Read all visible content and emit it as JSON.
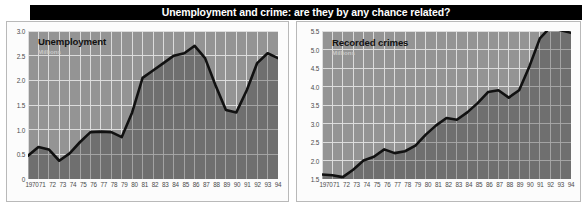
{
  "banner": {
    "title": "Unemployment and crime: are they by any chance related?",
    "background_color": "#000000",
    "text_color": "#ffffff"
  },
  "colors": {
    "plot_background": "#949494",
    "area_fill": "#6f6f6f",
    "gridline": "#e8e8e8",
    "line": "#111111",
    "axis_text": "#4a4a4a",
    "panel_border": "#b9b9b9",
    "caption_sub": "#c9c9c9"
  },
  "charts": [
    {
      "panel": "left",
      "caption_title": "Unemployment",
      "caption_sub": "Millions",
      "chart_data": {
        "type": "area",
        "title": "Unemployment",
        "subtitle": "Millions",
        "xlabel": "",
        "ylabel": "Millions",
        "ylim": [
          0,
          3.0
        ],
        "yticks": [
          0,
          0.5,
          1.0,
          1.5,
          2.0,
          2.5,
          3.0
        ],
        "ytick_labels": [
          "0",
          "0.5",
          "1.0",
          "1.5",
          "2.0",
          "2.5",
          "3.0"
        ],
        "grid": true,
        "legend": "none",
        "categories": [
          1970,
          1971,
          1972,
          1973,
          1974,
          1975,
          1976,
          1977,
          1978,
          1979,
          1980,
          1981,
          1982,
          1983,
          1984,
          1985,
          1986,
          1987,
          1988,
          1989,
          1990,
          1991,
          1992,
          1993,
          1994
        ],
        "xtick_labels": [
          "1970",
          "71",
          "72",
          "73",
          "74",
          "75",
          "76",
          "77",
          "78",
          "79",
          "80",
          "81",
          "82",
          "83",
          "84",
          "85",
          "86",
          "87",
          "88",
          "89",
          "90",
          "91",
          "92",
          "93",
          "94"
        ],
        "values": [
          0.47,
          0.65,
          0.6,
          0.37,
          0.52,
          0.75,
          0.95,
          0.96,
          0.95,
          0.85,
          1.35,
          2.05,
          2.2,
          2.35,
          2.5,
          2.55,
          2.7,
          2.45,
          1.9,
          1.4,
          1.35,
          1.8,
          2.35,
          2.55,
          2.45
        ]
      }
    },
    {
      "panel": "right",
      "caption_title": "Recorded crimes",
      "caption_sub": "Millions",
      "chart_data": {
        "type": "area",
        "title": "Recorded crimes",
        "subtitle": "Millions",
        "xlabel": "",
        "ylabel": "Millions",
        "ylim": [
          1.5,
          5.5
        ],
        "yticks": [
          1.5,
          2.0,
          2.5,
          3.0,
          3.5,
          4.0,
          4.5,
          5.0,
          5.5
        ],
        "ytick_labels": [
          "1.5",
          "2.0",
          "2.5",
          "3.0",
          "3.5",
          "4.0",
          "4.5",
          "5.0",
          "5.5"
        ],
        "grid": true,
        "legend": "none",
        "categories": [
          1970,
          1971,
          1972,
          1973,
          1974,
          1975,
          1976,
          1977,
          1978,
          1979,
          1980,
          1981,
          1982,
          1983,
          1984,
          1985,
          1986,
          1987,
          1988,
          1989,
          1990,
          1991,
          1992,
          1993,
          1994
        ],
        "xtick_labels": [
          "1970",
          "71",
          "72",
          "73",
          "74",
          "75",
          "76",
          "77",
          "78",
          "79",
          "80",
          "81",
          "82",
          "83",
          "84",
          "85",
          "86",
          "87",
          "88",
          "89",
          "90",
          "91",
          "92",
          "93",
          "94"
        ],
        "values": [
          1.62,
          1.6,
          1.55,
          1.75,
          2.0,
          2.1,
          2.3,
          2.2,
          2.25,
          2.4,
          2.7,
          2.95,
          3.15,
          3.1,
          3.3,
          3.55,
          3.85,
          3.9,
          3.7,
          3.9,
          4.55,
          5.3,
          5.6,
          5.52,
          5.45
        ]
      }
    }
  ]
}
